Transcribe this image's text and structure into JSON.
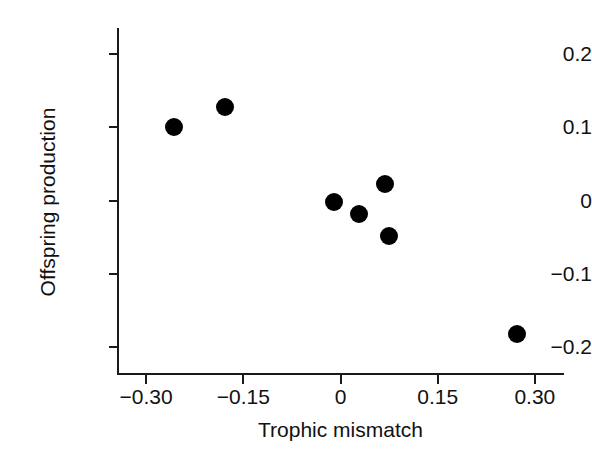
{
  "chart_data": {
    "type": "scatter",
    "title": "",
    "xlabel": "Trophic mismatch",
    "ylabel": "Offspring production",
    "xlim": [
      -0.345,
      0.345
    ],
    "ylim": [
      -0.235,
      0.235
    ],
    "grid": false,
    "legend": null,
    "xticks": [
      -0.3,
      -0.15,
      0,
      0.15,
      0.3
    ],
    "xtick_labels": [
      "−0.30",
      "−0.15",
      "0",
      "0.15",
      "0.30"
    ],
    "yticks": [
      0.2,
      0.1,
      0,
      -0.1,
      -0.2
    ],
    "ytick_labels": [
      "0.2",
      "0.1",
      "0",
      "−0.1",
      "−0.2"
    ],
    "marker": {
      "shape": "circle",
      "color": "#000000",
      "size_px": 18
    },
    "points": [
      {
        "x": -0.257,
        "y": 0.1
      },
      {
        "x": -0.178,
        "y": 0.128
      },
      {
        "x": -0.01,
        "y": -0.002
      },
      {
        "x": 0.028,
        "y": -0.018
      },
      {
        "x": 0.068,
        "y": 0.022
      },
      {
        "x": 0.075,
        "y": -0.048
      },
      {
        "x": 0.272,
        "y": -0.182
      }
    ]
  }
}
